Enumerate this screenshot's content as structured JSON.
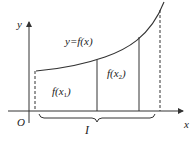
{
  "diagram": {
    "type": "function-graph",
    "labels": {
      "y_axis": "y",
      "x_axis": "x",
      "origin": "O",
      "curve": "y=f(x)",
      "interval": "I",
      "value1": {
        "main": "f(x",
        "sub": "1",
        "close": ")"
      },
      "value2": {
        "main": "f(x",
        "sub": "2",
        "close": ")"
      }
    },
    "colors": {
      "line": "#333333",
      "text": "#222222",
      "background": "#ffffff"
    }
  }
}
